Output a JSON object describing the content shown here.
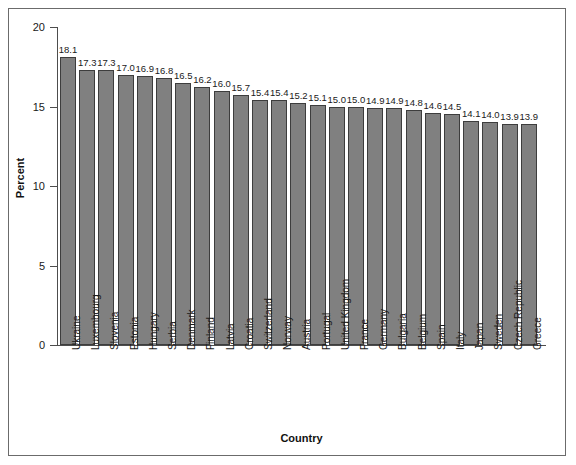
{
  "chart_data": {
    "type": "bar",
    "title": "",
    "xlabel": "Country",
    "ylabel": "Percent",
    "ylim": [
      0,
      20
    ],
    "yticks": [
      0,
      5,
      10,
      15,
      20
    ],
    "grid": false,
    "legend": "none",
    "bar_color": "#808080",
    "bar_edge_color": "#3d3d3d",
    "categories": [
      "Ukraine",
      "Luxembourg",
      "Slovenia",
      "Estonia",
      "Hungary",
      "Serbia",
      "Denmark",
      "Finland",
      "Latvia",
      "Croatia",
      "Switzerland",
      "Norway",
      "Austria",
      "Portugal",
      "United Kingdom",
      "France",
      "Germany",
      "Bulgaria",
      "Belgium",
      "Spain",
      "Italy",
      "Japan",
      "Sweden",
      "Czech Republic",
      "Greece"
    ],
    "values": [
      18.1,
      17.3,
      17.3,
      17.0,
      16.9,
      16.8,
      16.5,
      16.2,
      16.0,
      15.7,
      15.4,
      15.4,
      15.2,
      15.1,
      15.0,
      15.0,
      14.9,
      14.9,
      14.8,
      14.6,
      14.5,
      14.1,
      14.0,
      13.9,
      13.9
    ],
    "value_labels": [
      "18.1",
      "17.3",
      "17.3",
      "17.0",
      "16.9",
      "16.8",
      "16.5",
      "16.2",
      "16.0",
      "15.7",
      "15.4",
      "15.4",
      "15.2",
      "15.1",
      "15.0",
      "15.0",
      "14.9",
      "14.9",
      "14.8",
      "14.6",
      "14.5",
      "14.1",
      "14.0",
      "13.9",
      "13.9"
    ],
    "ytick_labels": [
      "0",
      "5",
      "10",
      "15",
      "20"
    ]
  }
}
